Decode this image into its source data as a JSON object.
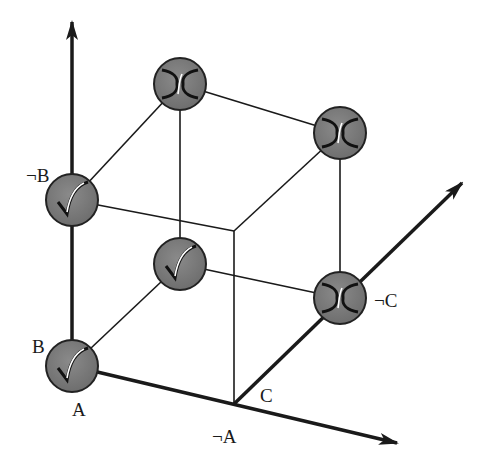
{
  "diagram": {
    "type": "boolean-cube",
    "colors": {
      "line": "#1a1a1a",
      "node_fill": "#7a7a7a",
      "node_stroke": "#222222",
      "glyph_highlight": "#ffffff"
    },
    "axes": [
      {
        "name": "B-axis",
        "from": [
          72,
          366
        ],
        "to": [
          72,
          22
        ]
      },
      {
        "name": "A-axis",
        "from": [
          72,
          366
        ],
        "to": [
          397,
          443
        ]
      },
      {
        "name": "C-axis",
        "from": [
          234,
          404
        ],
        "to": [
          462,
          183
        ]
      }
    ],
    "nodes": [
      {
        "id": "A-B-C",
        "x": 72,
        "y": 366,
        "glyph": "check"
      },
      {
        "id": "A-notB-C",
        "x": 72,
        "y": 200,
        "glyph": "check"
      },
      {
        "id": "A-B-notC",
        "x": 180,
        "y": 264,
        "glyph": "check"
      },
      {
        "id": "A-notB-notC",
        "x": 180,
        "y": 84,
        "glyph": "cross"
      },
      {
        "id": "notA-notB-notC",
        "x": 340,
        "y": 133,
        "glyph": "cross"
      },
      {
        "id": "notA-B-notC",
        "x": 340,
        "y": 298,
        "glyph": "cross"
      }
    ],
    "labels": {
      "notB": "¬B",
      "B": "B",
      "A": "A",
      "notA": "¬A",
      "C": "C",
      "notC": "¬C"
    }
  }
}
